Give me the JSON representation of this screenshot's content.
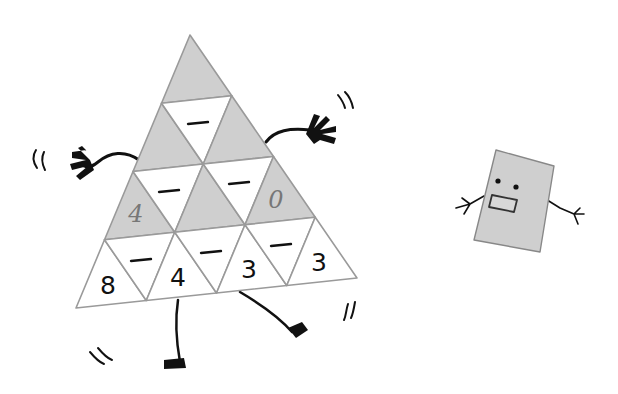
{
  "puzzle": {
    "type": "subtraction triangle pyramid",
    "rows": 4,
    "bottom_row_numbers": [
      "8",
      "4",
      "3",
      "3"
    ],
    "row3_values": [
      "4",
      "",
      "0"
    ],
    "row2_values": [
      "",
      ""
    ],
    "top_value": "",
    "operator_symbol": "−",
    "operator_count": 6
  },
  "characters": {
    "triangle_character": {
      "arms": 2,
      "legs": 2
    },
    "rectangle_character": {
      "eyes": 2,
      "mouth": "rectangle"
    }
  },
  "colors": {
    "shaded": "#cfcfcf",
    "outline": "#9a9a9a",
    "ink": "#111111",
    "handwriting": "#777777",
    "card": "#cfcfcf"
  }
}
